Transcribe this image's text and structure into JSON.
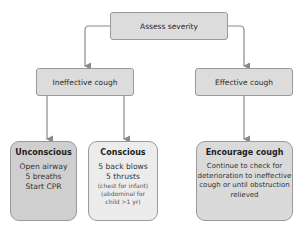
{
  "diagram": {
    "type": "flowchart",
    "root": {
      "label": "Assess severity"
    },
    "level2": [
      {
        "label": "Ineffective cough"
      },
      {
        "label": "Effective cough"
      }
    ],
    "level3": [
      {
        "title": "Unconscious",
        "lines": [
          "Open airway",
          "5 breaths",
          "Start CPR"
        ]
      },
      {
        "title": "Conscious",
        "lines": [
          "5 back blows",
          "5 thrusts"
        ],
        "notes": [
          "(chest for infant)",
          "(abdominal for",
          "child >1 yr)"
        ]
      },
      {
        "title": "Encourage cough",
        "lines": [
          "Continue to check for",
          "deterioration to ineffective",
          "cough or until obstruction",
          "relieved"
        ]
      }
    ],
    "colors": {
      "root": "#dcdcdc",
      "level2": "#dcdcdc",
      "unconscious": "#cfcfcf",
      "conscious": "#ececec",
      "encourage": "#dadada",
      "border": "#9a9a9a",
      "arrow": "#8a8a8a"
    }
  }
}
